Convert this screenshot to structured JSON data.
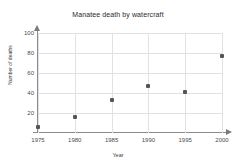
{
  "chart_data": {
    "type": "scatter",
    "title": "Manatee death by watercraft",
    "xlabel": "Year",
    "ylabel": "Number of deaths",
    "x": [
      1975,
      1980,
      1985,
      1990,
      1995,
      2000
    ],
    "values": [
      6,
      16,
      33,
      47,
      41,
      77
    ],
    "series": [
      {
        "name": "Manatee deaths",
        "points": [
          {
            "x": 1975,
            "y": 6
          },
          {
            "x": 1980,
            "y": 16
          },
          {
            "x": 1985,
            "y": 33
          },
          {
            "x": 1990,
            "y": 47
          },
          {
            "x": 1995,
            "y": 41
          },
          {
            "x": 2000,
            "y": 77
          }
        ]
      }
    ],
    "xlim": [
      1975,
      2000
    ],
    "ylim": [
      0,
      100
    ],
    "xticks": [
      "1975",
      "1980",
      "1985",
      "1990",
      "1995",
      "2000"
    ],
    "yticks": [
      "20",
      "40",
      "60",
      "80",
      "100"
    ],
    "ytick_values": [
      20,
      40,
      60,
      80,
      100
    ],
    "xtick_values": [
      1975,
      1980,
      1985,
      1990,
      1995,
      2000
    ],
    "grid": true,
    "legend": null,
    "marker_color": "#555558",
    "grid_color": "#e2e2e6",
    "axis_color": "#8b8b8b"
  }
}
